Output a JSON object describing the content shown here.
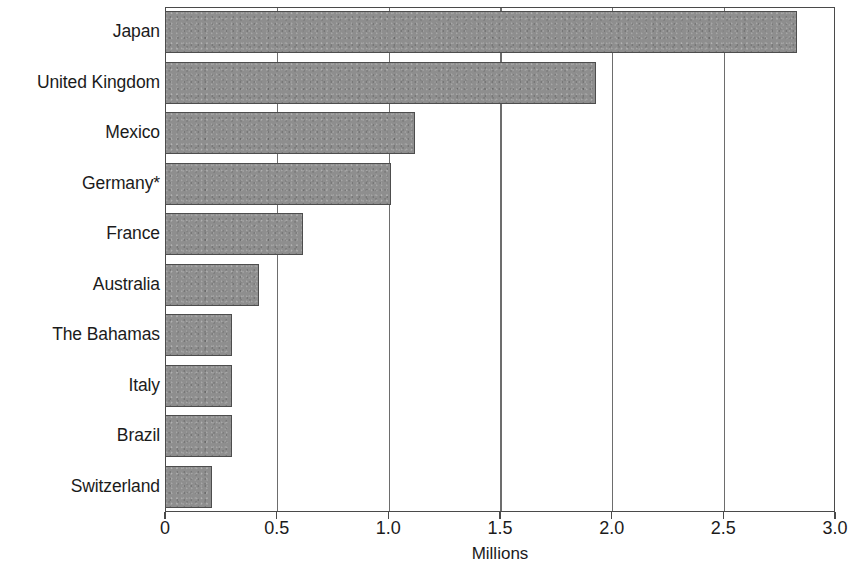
{
  "chart_data": {
    "type": "bar",
    "orientation": "horizontal",
    "title": "",
    "subtitle": "",
    "xlabel": "Millions",
    "ylabel": "",
    "categories": [
      "Japan",
      "United Kingdom",
      "Mexico",
      "Germany*",
      "France",
      "Australia",
      "The Bahamas",
      "Italy",
      "Brazil",
      "Switzerland"
    ],
    "values": [
      2.83,
      1.93,
      1.12,
      1.01,
      0.62,
      0.42,
      0.3,
      0.3,
      0.3,
      0.21
    ],
    "unit": "Millions",
    "xlim": [
      0,
      3.0
    ],
    "xticks": [
      0,
      0.5,
      1.0,
      1.5,
      2.0,
      2.5,
      3.0
    ],
    "xtick_labels": [
      "0",
      "0.5",
      "1.0",
      "1.5",
      "2.0",
      "2.5",
      "3.0"
    ],
    "grid": "vertical",
    "legend": null,
    "bar_color": "#8e8e8e",
    "bar_edge_color": "#4d4d4d",
    "axis_color": "#4a4a4a",
    "background_color": "#ffffff",
    "footnote_marker": "*"
  }
}
